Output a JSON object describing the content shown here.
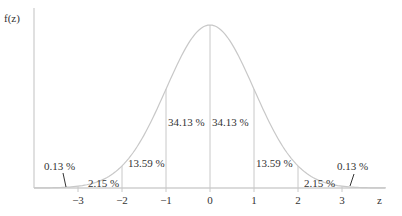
{
  "chart_data": {
    "type": "area",
    "title": "",
    "xlabel": "z",
    "ylabel": "f(z)",
    "xlim": [
      -4,
      4
    ],
    "x_ticks": [
      -3,
      -2,
      -1,
      0,
      1,
      2,
      3
    ],
    "x_tick_labels": [
      "−3",
      "−2",
      "−1",
      "0",
      "1",
      "2",
      "3"
    ],
    "curve": "standard normal density f(z)",
    "regions": [
      {
        "from": "-inf",
        "to": -3,
        "label": "0.13 %",
        "value": 0.13
      },
      {
        "from": -3,
        "to": -2,
        "label": "2.15 %",
        "value": 2.15
      },
      {
        "from": -2,
        "to": -1,
        "label": "13.59 %",
        "value": 13.59
      },
      {
        "from": -1,
        "to": 0,
        "label": "34.13 %",
        "value": 34.13
      },
      {
        "from": 0,
        "to": 1,
        "label": "34.13 %",
        "value": 34.13
      },
      {
        "from": 1,
        "to": 2,
        "label": "13.59 %",
        "value": 13.59
      },
      {
        "from": 2,
        "to": 3,
        "label": "2.15 %",
        "value": 2.15
      },
      {
        "from": 3,
        "to": "inf",
        "label": "0.13 %",
        "value": 0.13
      }
    ],
    "grid": false,
    "legend": null
  },
  "axes": {
    "y_label": "f(z)",
    "x_label": "z"
  },
  "colors": {
    "curve": "#c8c8c8",
    "lines": "#c8c8c8",
    "axis": "#cfcfcf",
    "text": "#333333",
    "pointer": "#333333"
  }
}
